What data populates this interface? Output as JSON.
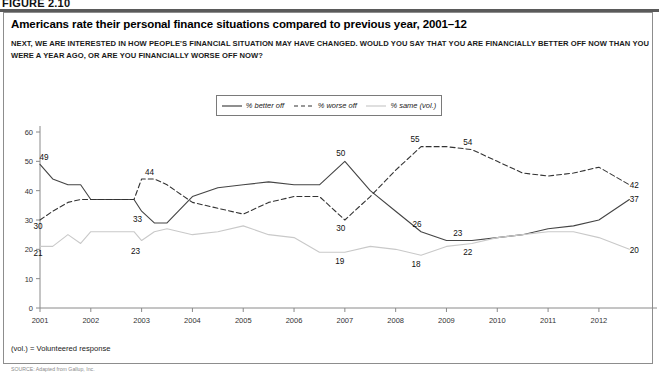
{
  "figure": {
    "number": "FIGURE 2.10",
    "title": "Americans rate their personal finance situations compared to previous year, 2001–12",
    "question": "NEXT, WE ARE INTERESTED IN HOW PEOPLE'S FINANCIAL SITUATION MAY HAVE CHANGED. WOULD YOU SAY THAT YOU ARE FINANCIALLY BETTER OFF NOW THAN YOU WERE A YEAR AGO, OR ARE YOU FINANCIALLY WORSE OFF NOW?",
    "footnote": "(vol.) = Volunteered response",
    "source": "SOURCE: Adapted from Gallup, Inc."
  },
  "legend": {
    "position": "top-center",
    "entries": [
      {
        "label": "% better off",
        "style": "solid",
        "color": "#444444"
      },
      {
        "label": "% worse off",
        "style": "dashed",
        "color": "#333333"
      },
      {
        "label": "% same (vol.)",
        "style": "solid",
        "color": "#c9c9c9"
      }
    ]
  },
  "chart_data": {
    "type": "line",
    "title": "Americans rate their personal finance situations compared to previous year, 2001–12",
    "xlabel": "",
    "ylabel": "",
    "xlim": [
      2001,
      2012.75
    ],
    "ylim": [
      0,
      60
    ],
    "yticks": [
      0,
      10,
      20,
      30,
      40,
      50,
      60
    ],
    "xticks": [
      2001,
      2002,
      2003,
      2004,
      2005,
      2006,
      2007,
      2008,
      2009,
      2010,
      2011,
      2012
    ],
    "tick_labels": [
      "2001",
      "2002",
      "2003",
      "2004",
      "2005",
      "2006",
      "2007",
      "2008",
      "2009",
      "2010",
      "2011",
      "2012"
    ],
    "grid": false,
    "x": [
      2001.0,
      2001.25,
      2001.55,
      2001.8,
      2002.0,
      2002.3,
      2002.6,
      2002.85,
      2003.0,
      2003.25,
      2003.5,
      2004.0,
      2004.5,
      2005.0,
      2005.5,
      2006.0,
      2006.5,
      2007.0,
      2007.5,
      2008.0,
      2008.5,
      2009.0,
      2009.5,
      2010.0,
      2010.5,
      2011.0,
      2011.5,
      2012.0,
      2012.6
    ],
    "series": [
      {
        "name": "% better off",
        "style": "solid",
        "color": "#444444",
        "values": [
          49,
          44,
          42,
          42,
          37,
          37,
          37,
          37,
          33,
          29,
          29,
          38,
          41,
          42,
          43,
          42,
          42,
          50,
          40,
          33,
          26,
          23,
          23,
          24,
          25,
          27,
          28,
          30,
          37
        ]
      },
      {
        "name": "% worse off",
        "style": "dashed",
        "color": "#333333",
        "values": [
          30,
          33,
          36,
          37,
          37,
          37,
          37,
          37,
          44,
          44,
          42,
          36,
          34,
          32,
          36,
          38,
          38,
          30,
          38,
          47,
          55,
          55,
          54,
          50,
          46,
          45,
          46,
          48,
          42
        ]
      },
      {
        "name": "% same (vol.)",
        "style": "solid",
        "color": "#c9c9c9",
        "values": [
          21,
          21,
          25,
          22,
          26,
          26,
          26,
          26,
          23,
          26,
          27,
          25,
          26,
          28,
          25,
          24,
          19,
          19,
          21,
          20,
          18,
          21,
          22,
          24,
          25,
          26,
          26,
          24,
          20
        ]
      }
    ],
    "annotations": [
      {
        "text": "49",
        "x": 2001.0,
        "y": 49,
        "dx": 4,
        "dy": -4,
        "series": "% better off"
      },
      {
        "text": "30",
        "x": 2001.0,
        "y": 30,
        "dx": -2,
        "dy": 9,
        "series": "% worse off"
      },
      {
        "text": "21",
        "x": 2001.0,
        "y": 21,
        "dx": -2,
        "dy": 10,
        "series": "% same (vol.)"
      },
      {
        "text": "44",
        "x": 2003.0,
        "y": 44,
        "dx": 8,
        "dy": -4,
        "series": "% worse off"
      },
      {
        "text": "33",
        "x": 2003.0,
        "y": 33,
        "dx": -4,
        "dy": 11,
        "series": "% better off"
      },
      {
        "text": "23",
        "x": 2003.0,
        "y": 23,
        "dx": -6,
        "dy": 13,
        "series": "% same (vol.)"
      },
      {
        "text": "50",
        "x": 2007.0,
        "y": 50,
        "dx": -4,
        "dy": -5,
        "series": "% better off"
      },
      {
        "text": "30",
        "x": 2007.0,
        "y": 30,
        "dx": -4,
        "dy": 11,
        "series": "% worse off"
      },
      {
        "text": "19",
        "x": 2007.0,
        "y": 19,
        "dx": -5,
        "dy": 12,
        "series": "% same (vol.)"
      },
      {
        "text": "55",
        "x": 2008.5,
        "y": 55,
        "dx": -6,
        "dy": -5,
        "series": "% worse off"
      },
      {
        "text": "26",
        "x": 2008.5,
        "y": 26,
        "dx": -4,
        "dy": -5,
        "series": "% better off"
      },
      {
        "text": "18",
        "x": 2008.5,
        "y": 18,
        "dx": -5,
        "dy": 12,
        "series": "% same (vol.)"
      },
      {
        "text": "54",
        "x": 2009.5,
        "y": 54,
        "dx": -4,
        "dy": -5,
        "series": "% worse off"
      },
      {
        "text": "23",
        "x": 2009.3,
        "y": 23,
        "dx": -4,
        "dy": -5,
        "series": "% better off"
      },
      {
        "text": "22",
        "x": 2009.5,
        "y": 22,
        "dx": -4,
        "dy": 12,
        "series": "% same (vol.)"
      },
      {
        "text": "42",
        "x": 2012.6,
        "y": 42,
        "dx": 5,
        "dy": 3,
        "series": "% worse off"
      },
      {
        "text": "37",
        "x": 2012.6,
        "y": 37,
        "dx": 5,
        "dy": 3,
        "series": "% better off"
      },
      {
        "text": "20",
        "x": 2012.6,
        "y": 20,
        "dx": 5,
        "dy": 4,
        "series": "% same (vol.)"
      }
    ]
  }
}
